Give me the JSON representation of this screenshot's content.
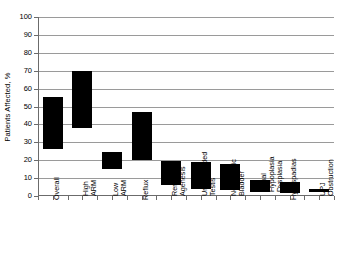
{
  "chart_data": {
    "type": "bar",
    "bar_style": "floating-range",
    "title": "",
    "subtitle": "",
    "xlabel": "",
    "ylabel": "Patients Affected, %",
    "ylim": [
      0,
      100
    ],
    "ytick_step": 10,
    "yticks": [
      0,
      10,
      20,
      30,
      40,
      50,
      60,
      70,
      80,
      90,
      100
    ],
    "ytick_labels": [
      "0",
      "10",
      "20",
      "30",
      "40",
      "50",
      "60",
      "70",
      "80",
      "90",
      "100"
    ],
    "grid": true,
    "grid_axis": "y",
    "legend": false,
    "legend_position": "none",
    "bar_color": "#000000",
    "grid_color": "#9a9a9a",
    "axis_color": "#6b6b6b",
    "categories": [
      "Overall",
      "High ARM",
      "Low ARM",
      "Reflux",
      "Renal Agenesis",
      "Undescended Testis",
      "Neurogenic Bladder",
      "Renal Hypoplasia Dysplasia",
      "Hypospadias",
      "UPJ Obstruction"
    ],
    "category_lines": [
      [
        "Overall"
      ],
      [
        "High",
        "ARM"
      ],
      [
        "Low",
        "ARM"
      ],
      [
        "Reflux"
      ],
      [
        "Renal",
        "Agenesis"
      ],
      [
        "Undescended",
        "Testis"
      ],
      [
        "Neurogenic",
        "Bladder"
      ],
      [
        "Renal",
        "Hypoplasia",
        "Dysplasia"
      ],
      [
        "Hypospadias"
      ],
      [
        "UPJ",
        "Obstruction"
      ]
    ],
    "low": [
      26,
      38,
      15,
      20,
      6,
      4,
      3.5,
      2,
      1.5,
      2
    ],
    "high": [
      55.5,
      70,
      24.5,
      47,
      19.5,
      19,
      18,
      9,
      8,
      4
    ],
    "values": [
      {
        "category": "Overall",
        "low": 26,
        "high": 55.5
      },
      {
        "category": "High ARM",
        "low": 38,
        "high": 70
      },
      {
        "category": "Low ARM",
        "low": 15,
        "high": 24.5
      },
      {
        "category": "Reflux",
        "low": 20,
        "high": 47
      },
      {
        "category": "Renal Agenesis",
        "low": 6,
        "high": 19.5
      },
      {
        "category": "Undescended Testis",
        "low": 4,
        "high": 19
      },
      {
        "category": "Neurogenic Bladder",
        "low": 3.5,
        "high": 18
      },
      {
        "category": "Renal Hypoplasia Dysplasia",
        "low": 2,
        "high": 9
      },
      {
        "category": "Hypospadias",
        "low": 1.5,
        "high": 8
      },
      {
        "category": "UPJ Obstruction",
        "low": 2,
        "high": 4
      }
    ]
  }
}
